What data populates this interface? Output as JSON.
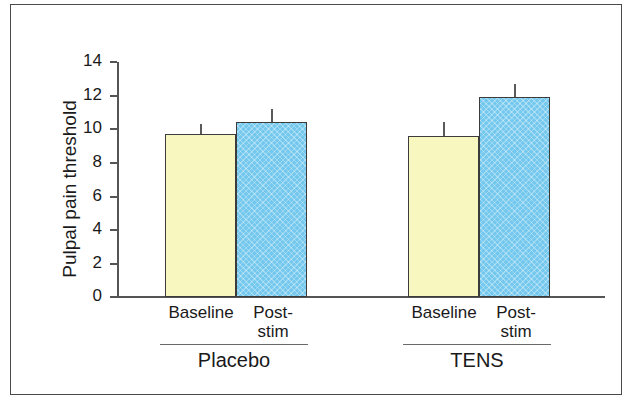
{
  "chart_data": {
    "type": "bar",
    "title": "",
    "xlabel": "",
    "ylabel": "Pulpal pain threshold",
    "ylim": [
      0,
      14
    ],
    "ytick_labels": [
      "0",
      "2",
      "4",
      "6",
      "8",
      "10",
      "12",
      "14"
    ],
    "ytick_values": [
      0,
      2,
      4,
      6,
      8,
      10,
      12,
      14
    ],
    "grid": false,
    "legend": "none",
    "groups": [
      "Placebo",
      "TENS"
    ],
    "categories": [
      "Baseline",
      "Post-stim"
    ],
    "series": [
      {
        "name": "Baseline",
        "color": "#f8f7c0",
        "values": [
          9.7,
          9.6
        ]
      },
      {
        "name": "Post-stim",
        "color": "#74c8ee",
        "values": [
          10.4,
          11.9
        ]
      }
    ],
    "error_upper": [
      {
        "name": "Baseline",
        "values": [
          0.6,
          0.8
        ]
      },
      {
        "name": "Post-stim",
        "values": [
          0.8,
          0.8
        ]
      }
    ],
    "bars": [
      {
        "group": "Placebo",
        "category": "Baseline",
        "value": 9.7,
        "error_upper": 0.6,
        "color": "#f8f7c0"
      },
      {
        "group": "Placebo",
        "category": "Post-stim",
        "value": 10.4,
        "error_upper": 0.8,
        "color": "#74c8ee"
      },
      {
        "group": "TENS",
        "category": "Baseline",
        "value": 9.6,
        "error_upper": 0.8,
        "color": "#f8f7c0"
      },
      {
        "group": "TENS",
        "category": "Post-stim",
        "value": 11.9,
        "error_upper": 0.8,
        "color": "#74c8ee"
      }
    ]
  },
  "axis": {
    "y_title": "Pulpal pain threshold",
    "ticks": [
      "14",
      "12",
      "10",
      "8",
      "6",
      "4",
      "2",
      "0"
    ]
  },
  "xaxis": {
    "placebo": {
      "baseline_label": "Baseline",
      "poststim_label_line1": "Post-",
      "poststim_label_line2": "stim",
      "group_label": "Placebo"
    },
    "tens": {
      "baseline_label": "Baseline",
      "poststim_label_line1": "Post-",
      "poststim_label_line2": "stim",
      "group_label": "TENS"
    }
  }
}
